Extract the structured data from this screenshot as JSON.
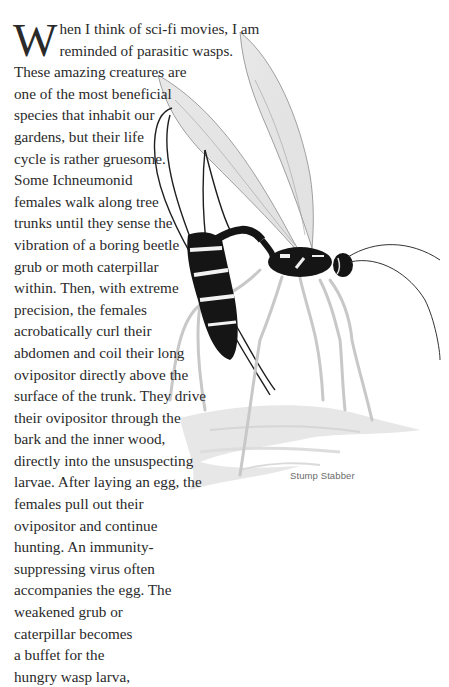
{
  "article": {
    "drop_cap": "W",
    "first_lines": [
      "hen I think of sci-fi movies, I am",
      "reminded of parasitic wasps."
    ],
    "lines": [
      "These amazing creatures are",
      "one of the most beneficial",
      "species that inhabit our",
      "gardens, but their life",
      "cycle is rather gruesome.",
      "Some Ichneumonid",
      "females walk along tree",
      "trunks until they sense the",
      "vibration of a boring beetle",
      "grub or moth caterpillar",
      "within. Then, with extreme",
      "precision, the females",
      "acrobatically curl their",
      "abdomen and coil their long",
      "ovipositor directly above the",
      "surface of the trunk. They drive",
      "their ovipositor through the",
      "bark and the inner wood,",
      "directly into the unsuspecting",
      "larvae. After laying an egg, the",
      "females pull out their",
      "ovipositor and continue",
      "hunting. An immunity-",
      "suppressing virus often",
      "accompanies the egg. The",
      "weakened grub or",
      "caterpillar becomes",
      "a buffet for the",
      "hungry wasp larva,"
    ]
  },
  "illustration": {
    "subject": "parasitic-wasp-ichneumonid",
    "caption": "Stump Stabber"
  }
}
